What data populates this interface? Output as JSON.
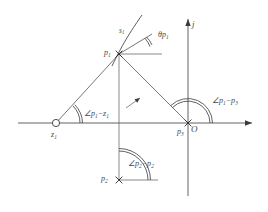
{
  "figure": {
    "type": "root-locus-angle-diagram",
    "background": "#ffffff",
    "ink_color": "#4a4a4a",
    "axes": {
      "imaginary_axis_label": "j",
      "real_axis_label": "",
      "origin_label": "O"
    },
    "points": [
      {
        "id": "z1",
        "label": "z",
        "subscript": "1",
        "marker": "open-circle",
        "x": 56,
        "y": 123
      },
      {
        "id": "p1",
        "label": "p",
        "subscript": "1",
        "marker": "cross",
        "x": 119,
        "y": 54
      },
      {
        "id": "p3",
        "label": "p",
        "subscript": "3",
        "marker": "cross",
        "x": 188,
        "y": 123
      },
      {
        "id": "p2",
        "label": "p",
        "subscript": "2",
        "marker": "cross",
        "x": 119,
        "y": 180
      }
    ],
    "curve": {
      "id": "s1",
      "label": "s",
      "subscript": "1"
    },
    "angles": [
      {
        "id": "theta-p1",
        "prefix": "",
        "text": "θp",
        "subscript": "1",
        "at": "p1"
      },
      {
        "id": "angle-p1-z1",
        "prefix": "∠",
        "text": "p",
        "subscript": "1",
        "minus": "−",
        "text2": "z",
        "subscript2": "1",
        "at": "z1"
      },
      {
        "id": "angle-p1-p3",
        "prefix": "∠",
        "text": "p",
        "subscript": "1",
        "minus": "−",
        "text2": "p",
        "subscript2": "3",
        "at": "p3"
      },
      {
        "id": "angle-p2-p2",
        "prefix": "∠",
        "text": "p",
        "subscript": "2",
        "minus": "−",
        "text2": "p",
        "subscript2": "2",
        "at": "p2"
      }
    ],
    "labels": {
      "z1_point": "z",
      "z1_sub": "1",
      "p1_point": "p",
      "p1_sub": "1",
      "p2_point": "p",
      "p2_sub": "2",
      "p3_point": "p",
      "p3_sub": "3",
      "origin": "O",
      "j_axis": "j",
      "s_curve": "s",
      "s_curve_sub": "1",
      "theta_p1": "θp",
      "theta_p1_sub": "1",
      "ang_p1_z1_a": "∠p",
      "ang_p1_z1_sub1": "1",
      "ang_p1_z1_b": "−z",
      "ang_p1_z1_sub2": "1",
      "ang_p1_p3_a": "∠p",
      "ang_p1_p3_sub1": "1",
      "ang_p1_p3_b": "−p",
      "ang_p1_p3_sub2": "3",
      "ang_p2_p2_a": "∠p",
      "ang_p2_p2_sub1": "2",
      "ang_p2_p2_b": "−p",
      "ang_p2_p2_sub2": "2"
    }
  }
}
